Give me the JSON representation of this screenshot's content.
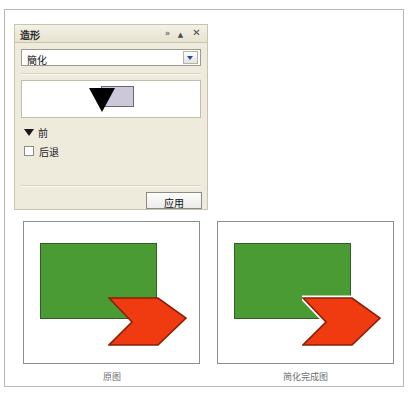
{
  "panel": {
    "title": "造形",
    "controls": {
      "expand": "»",
      "collapse": "▲",
      "close": "✕"
    },
    "mode_select": {
      "value": "簡化",
      "icon": "chevron-down-icon"
    },
    "preview": {
      "rect_fill": "#cdc7da",
      "triangle_fill": "#000000"
    },
    "front_row": {
      "label": "前",
      "disclosure_icon": "triangle-down-icon",
      "expanded": true
    },
    "back_row": {
      "label": "后退",
      "checked": false
    },
    "apply_button": {
      "label": "应用"
    }
  },
  "comparison": {
    "left": {
      "caption": "原图",
      "green_fill": "#4a9b33",
      "green_stroke": "#2f5f22",
      "arrow_fill": "#f03a10",
      "arrow_stroke": "#8a1f08",
      "arrow_halo": false
    },
    "right": {
      "caption": "简化完成图",
      "green_fill": "#4a9b33",
      "green_stroke": "#2f5f22",
      "arrow_fill": "#f03a10",
      "arrow_stroke": "#8a1f08",
      "arrow_halo": true
    }
  },
  "colors": {
    "panel_background": "#eeeadc",
    "panel_border": "#c9c4ae",
    "page_border": "#b9b9b4",
    "caption_text": "#6f6f6f"
  }
}
